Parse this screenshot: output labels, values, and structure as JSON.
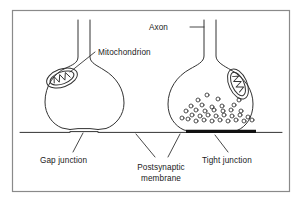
{
  "figure": {
    "kind": "biological-diagram",
    "background_color": "#ffffff",
    "stroke_color": "#333333",
    "text_color": "#1a1a1a",
    "fill_color": "#ffffff",
    "junction_bar_color": "#111111",
    "border": {
      "x": 12,
      "y": 10,
      "width": 278,
      "height": 182,
      "color": "#8a8a8a"
    }
  },
  "labels": {
    "mitochondrion": "Mitochondrion",
    "axon": "Axon",
    "gap_junction": "Gap junction",
    "postsynaptic_membrane_line1": "Postsynaptic",
    "postsynaptic_membrane_line2": "membrane",
    "tight_junction": "Tight junction"
  },
  "left_terminal": {
    "name": "gap-junction-synapse",
    "axon_x_left": 78,
    "axon_x_right": 90,
    "axon_y_top": 20,
    "bulb_center_x": 84,
    "has_vesicles": false,
    "junction_type": "gap"
  },
  "right_terminal": {
    "name": "tight-junction-synapse",
    "axon_x_left": 204,
    "axon_x_right": 216,
    "axon_y_top": 20,
    "bulb_center_x": 210,
    "has_vesicles": true,
    "vesicle_count": 34,
    "junction_type": "tight"
  },
  "membrane": {
    "y": 131,
    "x_start": 20,
    "x_end": 282
  },
  "vesicles": [
    {
      "cx": 188,
      "cy": 119,
      "r": 2.0
    },
    {
      "cx": 196,
      "cy": 121,
      "r": 2.0
    },
    {
      "cx": 204,
      "cy": 120,
      "r": 2.0
    },
    {
      "cx": 212,
      "cy": 121,
      "r": 2.0
    },
    {
      "cx": 220,
      "cy": 120,
      "r": 2.0
    },
    {
      "cx": 228,
      "cy": 121,
      "r": 2.0
    },
    {
      "cx": 236,
      "cy": 120,
      "r": 2.0
    },
    {
      "cx": 244,
      "cy": 121,
      "r": 2.0
    },
    {
      "cx": 252,
      "cy": 120,
      "r": 2.0
    },
    {
      "cx": 182,
      "cy": 118,
      "r": 2.0
    },
    {
      "cx": 192,
      "cy": 115,
      "r": 2.0
    },
    {
      "cx": 200,
      "cy": 116,
      "r": 2.0
    },
    {
      "cx": 208,
      "cy": 115,
      "r": 2.0
    },
    {
      "cx": 216,
      "cy": 116,
      "r": 2.0
    },
    {
      "cx": 224,
      "cy": 115,
      "r": 2.0
    },
    {
      "cx": 232,
      "cy": 116,
      "r": 2.0
    },
    {
      "cx": 240,
      "cy": 115,
      "r": 2.0
    },
    {
      "cx": 248,
      "cy": 117,
      "r": 2.0
    },
    {
      "cx": 186,
      "cy": 111,
      "r": 2.0
    },
    {
      "cx": 196,
      "cy": 110,
      "r": 2.0
    },
    {
      "cx": 205,
      "cy": 111,
      "r": 2.0
    },
    {
      "cx": 214,
      "cy": 110,
      "r": 2.0
    },
    {
      "cx": 223,
      "cy": 111,
      "r": 2.0
    },
    {
      "cx": 231,
      "cy": 110,
      "r": 2.0
    },
    {
      "cx": 241,
      "cy": 111,
      "r": 2.0
    },
    {
      "cx": 191,
      "cy": 106,
      "r": 2.0
    },
    {
      "cx": 202,
      "cy": 105,
      "r": 2.0
    },
    {
      "cx": 212,
      "cy": 107,
      "r": 2.0
    },
    {
      "cx": 222,
      "cy": 106,
      "r": 2.0
    },
    {
      "cx": 234,
      "cy": 105,
      "r": 2.0
    },
    {
      "cx": 198,
      "cy": 100,
      "r": 2.0
    },
    {
      "cx": 218,
      "cy": 99,
      "r": 2.0
    },
    {
      "cx": 239,
      "cy": 100,
      "r": 2.0
    },
    {
      "cx": 207,
      "cy": 95,
      "r": 2.0
    }
  ]
}
